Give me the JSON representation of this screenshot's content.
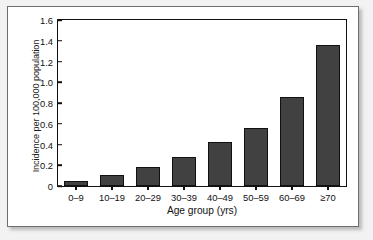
{
  "chart_data": {
    "type": "bar",
    "title": "",
    "subtitle": "",
    "xlabel": "Age group (yrs)",
    "ylabel": "Incidence per 100,000 population",
    "categories": [
      "0–9",
      "10–19",
      "20–29",
      "30–39",
      "40–49",
      "50–59",
      "60–69",
      "≥70"
    ],
    "values": [
      0.05,
      0.11,
      0.18,
      0.28,
      0.42,
      0.56,
      0.86,
      1.36
    ],
    "ylim": [
      0,
      1.6
    ],
    "ytick_labels": [
      "0",
      "0.2",
      "0.4",
      "0.6",
      "0.8",
      "1.0",
      "1.2",
      "1.4",
      "1.6"
    ],
    "ytick_values": [
      0,
      0.2,
      0.4,
      0.6,
      0.8,
      1.0,
      1.2,
      1.4,
      1.6
    ],
    "grid": false,
    "legend": null,
    "legend_position": "none",
    "bar_color": "#414141",
    "bar_edge_color": "#111111",
    "axis_color": "#111111",
    "plot_background": "#ffffff",
    "page_background": "#f2f2f2"
  }
}
